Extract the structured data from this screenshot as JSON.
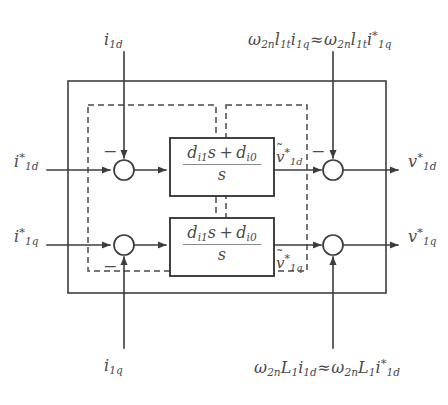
{
  "figure": {
    "type": "control-block-diagram",
    "canvas": {
      "width": 448,
      "height": 405
    },
    "background_color": "#ffffff",
    "line_color": "#4a4a4a",
    "text_color": "#4a4a4a"
  },
  "inputs": [
    {
      "id": "ref-id",
      "label_html": "<span class=\"up\"> </span>i<sup>*</sup><sub>1d</sub>",
      "plain": "i*_1d",
      "position": "left-upper",
      "x": 14,
      "y": 152
    },
    {
      "id": "ref-iq",
      "label_html": "i<sup>*</sup><sub>1q</sub>",
      "plain": "i*_1q",
      "position": "left-lower",
      "x": 14,
      "y": 227
    }
  ],
  "outputs": [
    {
      "id": "out-vd",
      "label_html": "v<sup>*</sup><sub>1d</sub>",
      "plain": "v*_1d",
      "position": "right-upper",
      "x": 408,
      "y": 152
    },
    {
      "id": "out-vq",
      "label_html": "v<sup>*</sup><sub>1q</sub>",
      "plain": "v*_1q",
      "position": "right-lower",
      "x": 408,
      "y": 227
    }
  ],
  "feedback_labels": [
    {
      "id": "fb-i1d",
      "label_html": "i<sub>1d</sub>",
      "plain": "i_1d",
      "position": "top-left",
      "x": 104,
      "y": 32
    },
    {
      "id": "fb-i1q",
      "label_html": "i<sub>1q</sub>",
      "plain": "i_1q",
      "position": "bottom-left",
      "x": 104,
      "y": 358
    },
    {
      "id": "decouple-top",
      "label_html": "&#969;<sub>2n</sub>l<sub>1t</sub>i<sub>1q</sub><span class=\"approx\">&#8776;</span>&#969;<sub>2n</sub>l<sub>1t</sub>i<sup>*</sup><sub>1q</sub>",
      "plain": "w_2n l_1t i_1q ~= w_2n l_1t i*_1q",
      "position": "top-right",
      "x": 248,
      "y": 30
    },
    {
      "id": "decouple-bottom",
      "label_html": "&#969;<sub>2n</sub>L<sub>1</sub>i<sub>1d</sub><span class=\"approx\">&#8776;</span>&#969;<sub>2n</sub>L<sub>1</sub>i<sup>*</sup><sub>1d</sub>",
      "plain": "w_2n L_1 i_1d ~= w_2n L_1 i*_1d",
      "position": "bottom-right",
      "x": 254,
      "y": 358
    }
  ],
  "blocks": [
    {
      "id": "tf-upper",
      "numerator_html": "d<sub>i1</sub>s&#8201;+&#8201;d<sub>i0</sub>",
      "denominator_html": "s",
      "plain": "(d_i1 s + d_i0) / s",
      "x": 170,
      "y": 138,
      "width": 104,
      "height": 58
    },
    {
      "id": "tf-lower",
      "numerator_html": "d<sub>i1</sub>s&#8201;+&#8201;d<sub>i0</sub>",
      "denominator_html": "s",
      "plain": "(d_i1 s + d_i0) / s",
      "x": 170,
      "y": 218,
      "width": 104,
      "height": 58
    }
  ],
  "intermediate_labels": [
    {
      "id": "v-tilde-d",
      "label_html": "<span class=\"tilde-wrap\"><span class=\"tilde-mark\">&#732;</span>v</span><sup>*</sup><sub>1d</sub>",
      "plain": "v~*_1d",
      "x": 276,
      "y": 148
    },
    {
      "id": "v-tilde-q",
      "label_html": "<span class=\"tilde-wrap\"><span class=\"tilde-mark\">&#732;</span>v</span><sup>*</sup><sub>1q</sub>",
      "plain": "v~*_1q",
      "x": 276,
      "y": 254
    }
  ],
  "junctions": [
    {
      "id": "sum-1",
      "cx": 124,
      "cy": 170,
      "r": 10,
      "sign": "-",
      "sign_x": 103,
      "sign_y": 143
    },
    {
      "id": "sum-2",
      "cx": 124,
      "cy": 245,
      "r": 10,
      "sign": "-",
      "sign_x": 103,
      "sign_y": 258
    },
    {
      "id": "sum-3",
      "cx": 333,
      "cy": 170,
      "r": 10,
      "sign": "-",
      "sign_x": 311,
      "sign_y": 143
    },
    {
      "id": "sum-4",
      "cx": 333,
      "cy": 245,
      "r": 10,
      "sign": "",
      "sign_x": 311,
      "sign_y": 258
    }
  ],
  "boxes": {
    "outer_solid": {
      "x": 68,
      "y": 81,
      "width": 318,
      "height": 212
    },
    "dashed_left": {
      "x": 88,
      "y": 105,
      "width": 128,
      "height": 166
    },
    "dashed_right": {
      "x": 226,
      "y": 105,
      "width": 81,
      "height": 166
    }
  },
  "sign_symbol": "−"
}
